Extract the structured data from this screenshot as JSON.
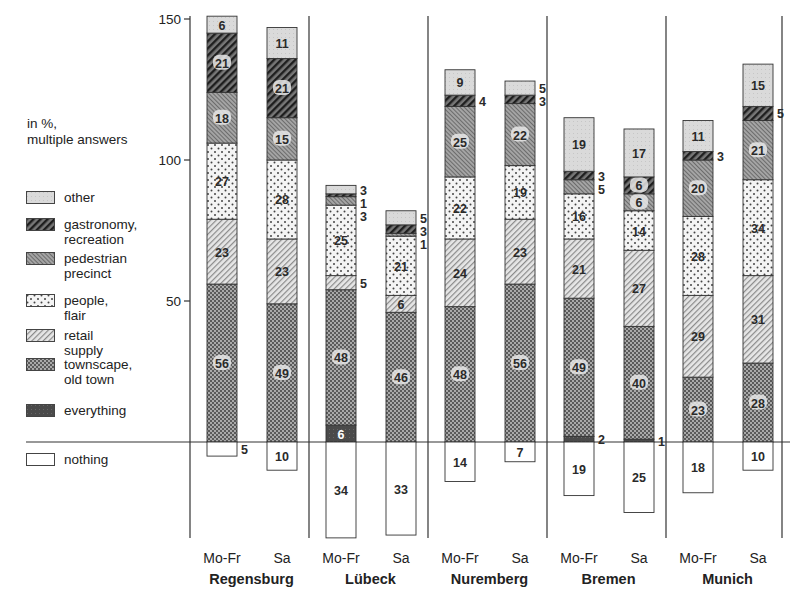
{
  "chart_data": {
    "type": "bar",
    "stacked": true,
    "title": "",
    "note": "in %,\nmultiple answers",
    "ylabel": "",
    "ylim": [
      -35,
      150
    ],
    "yticks": [
      50,
      100,
      150
    ],
    "grid": false,
    "legend_position": "left",
    "cities": [
      "Regensburg",
      "Lübeck",
      "Nuremberg",
      "Bremen",
      "Munich"
    ],
    "periods": [
      "Mo-Fr",
      "Sa"
    ],
    "categories": [
      "Regensburg Mo-Fr",
      "Regensburg Sa",
      "Lübeck Mo-Fr",
      "Lübeck Sa",
      "Nuremberg Mo-Fr",
      "Nuremberg Sa",
      "Bremen Mo-Fr",
      "Bremen Sa",
      "Munich Mo-Fr",
      "Munich Sa"
    ],
    "series": [
      {
        "key": "everything",
        "name": "everything",
        "values": [
          0,
          0,
          6,
          0,
          0,
          0,
          2,
          1,
          0,
          0
        ]
      },
      {
        "key": "townscape",
        "name": "townscape, old town",
        "values": [
          56,
          49,
          48,
          46,
          48,
          56,
          49,
          40,
          23,
          28
        ]
      },
      {
        "key": "retail",
        "name": "retail supply",
        "values": [
          23,
          23,
          5,
          6,
          24,
          23,
          21,
          27,
          29,
          31
        ]
      },
      {
        "key": "people",
        "name": "people, flair",
        "values": [
          27,
          28,
          25,
          21,
          22,
          19,
          16,
          14,
          28,
          34
        ]
      },
      {
        "key": "pedestrian",
        "name": "pedestrian precinct",
        "values": [
          18,
          15,
          3,
          1,
          25,
          22,
          5,
          6,
          20,
          21
        ]
      },
      {
        "key": "gastronomy",
        "name": "gastronomy, recreation",
        "values": [
          21,
          21,
          1,
          3,
          4,
          3,
          3,
          6,
          3,
          5
        ]
      },
      {
        "key": "other",
        "name": "other",
        "values": [
          6,
          11,
          3,
          5,
          9,
          5,
          19,
          17,
          11,
          15
        ]
      },
      {
        "key": "nothing",
        "name": "nothing",
        "negative": true,
        "values": [
          5,
          10,
          34,
          33,
          14,
          7,
          19,
          25,
          18,
          10
        ]
      }
    ],
    "outside_labels": [
      [],
      [],
      [
        "other",
        "gastronomy",
        "pedestrian",
        "retail"
      ],
      [
        "other",
        "gastronomy",
        "pedestrian"
      ],
      [
        "gastronomy"
      ],
      [
        "other",
        "gastronomy"
      ],
      [
        "gastronomy",
        "pedestrian",
        "everything"
      ],
      [
        "everything"
      ],
      [
        "gastronomy"
      ],
      [
        "gastronomy"
      ]
    ],
    "outside_nothing": [
      0
    ]
  },
  "legend": {
    "title": "in %,\nmultiple answers",
    "items": [
      {
        "key": "other",
        "label": "other"
      },
      {
        "key": "gastronomy",
        "label": "gastronomy,\nrecreation"
      },
      {
        "key": "pedestrian",
        "label": "pedestrian\nprecinct"
      },
      {
        "key": "people",
        "label": "people, flair"
      },
      {
        "key": "retail",
        "label": "retail supply"
      },
      {
        "key": "townscape",
        "label": "townscape,\nold town"
      },
      {
        "key": "everything",
        "label": "everything"
      },
      {
        "key": "nothing",
        "label": "nothing"
      }
    ]
  },
  "colors": {
    "other": "#d9d9d9",
    "gastronomy": "#3a3a3a",
    "pedestrian": "#8a8a8a",
    "people": "#f2f2f2",
    "retail": "#c8c8c8",
    "townscape": "#7c7c7c",
    "everything": "#555555",
    "nothing": "#ffffff",
    "axis": "#333333"
  }
}
